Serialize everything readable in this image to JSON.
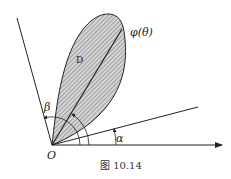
{
  "figure": {
    "caption": "图 10.14",
    "labels": {
      "curve": "φ(θ)",
      "region": "D",
      "origin": "O",
      "alpha": "α",
      "beta": "β"
    },
    "colors": {
      "line": "#222222",
      "fill": "#cfcfcf",
      "hatch": "#555555"
    }
  }
}
